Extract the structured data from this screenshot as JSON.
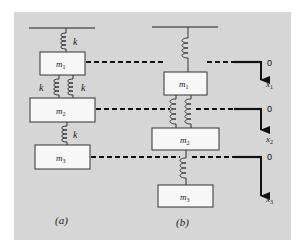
{
  "figure": {
    "panel_color": "#d6d6d6",
    "mass_fill": "#f7f7f7",
    "panels": [
      {
        "id": "a",
        "caption": "(a)",
        "top_spring_label": "k",
        "middle_spring_labels": [
          "k",
          "k"
        ],
        "bottom_spring_label": "k",
        "masses": [
          "m1",
          "m2",
          "m3"
        ]
      },
      {
        "id": "b",
        "caption": "(b)",
        "masses": [
          "m1",
          "m2",
          "m3"
        ]
      }
    ],
    "mass_labels": {
      "m1_base": "m",
      "m1_sub": "1",
      "m2_base": "m",
      "m2_sub": "2",
      "m3_base": "m",
      "m3_sub": "3"
    },
    "spring_k": "k",
    "reference_lines": [
      {
        "zero_label": "0",
        "coord_base": "x",
        "coord_sub": "1"
      },
      {
        "zero_label": "0",
        "coord_base": "x",
        "coord_sub": "2"
      },
      {
        "zero_label": "0",
        "coord_base": "x",
        "coord_sub": "3"
      }
    ]
  }
}
